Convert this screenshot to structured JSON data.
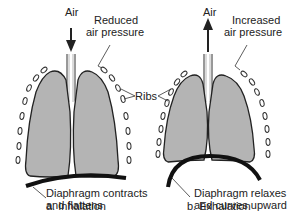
{
  "panels": [
    {
      "id": "inhalation",
      "caption": "a. Inhalation",
      "air_label": "Air",
      "air_direction": "down",
      "pressure_label_line1": "Reduced",
      "pressure_label_line2": "air pressure",
      "diaphragm_label_line1": "Diaphragm contracts",
      "diaphragm_label_line2": "and flattens"
    },
    {
      "id": "exhalation",
      "caption": "b. Exhalation",
      "air_label": "Air",
      "air_direction": "up",
      "pressure_label_line1": "Increased",
      "pressure_label_line2": "air pressure",
      "diaphragm_label_line1": "Diaphragm relaxes",
      "diaphragm_label_line2": "and curves upward"
    }
  ],
  "shared": {
    "ribs_label": "Ribs"
  },
  "colors": {
    "lung_fill": "#b4b4b4",
    "outline": "#222222",
    "diaphragm": "#111111"
  }
}
